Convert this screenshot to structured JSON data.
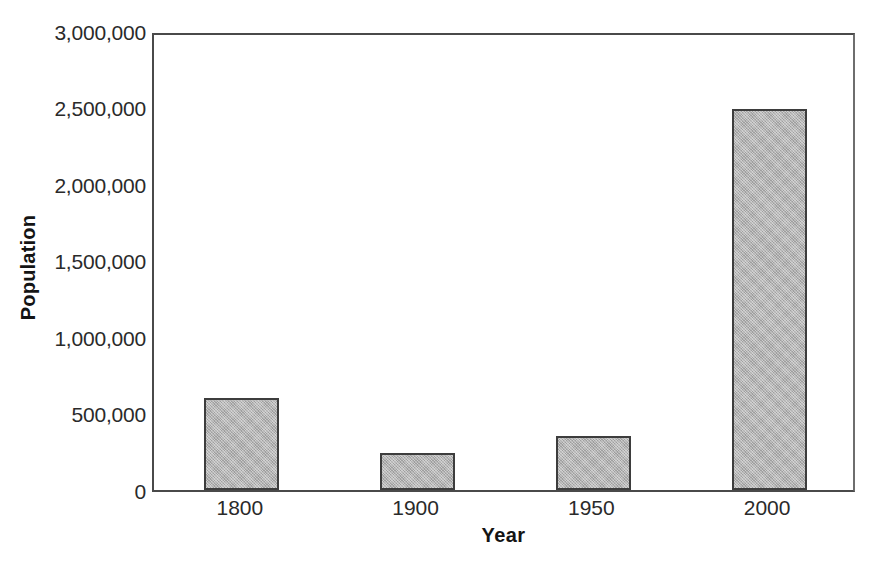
{
  "chart_data": {
    "type": "bar",
    "title": "",
    "subtitle": "",
    "xlabel": "Year",
    "ylabel": "Population",
    "categories": [
      "1800",
      "1900",
      "1950",
      "2000"
    ],
    "values": [
      600000,
      240000,
      350000,
      2490000
    ],
    "series": [
      {
        "name": "Population",
        "values": [
          600000,
          240000,
          350000,
          2490000
        ]
      }
    ],
    "ylim": [
      0,
      3000000
    ],
    "ytick_values": [
      0,
      500000,
      1000000,
      1500000,
      2000000,
      2500000,
      3000000
    ],
    "ytick_labels": [
      "0",
      "500,000",
      "1,000,000",
      "1,500,000",
      "2,000,000",
      "2,500,000",
      "3,000,000"
    ],
    "grid": false,
    "legend": false,
    "legend_position": "none",
    "bar_fill_color": "#aeaeae",
    "bar_edge_color": "#3d3d3d",
    "axis_color": "#4a4a4a",
    "background_color": "#ffffff"
  },
  "axes": {
    "y_title": "Population",
    "x_title": "Year"
  }
}
